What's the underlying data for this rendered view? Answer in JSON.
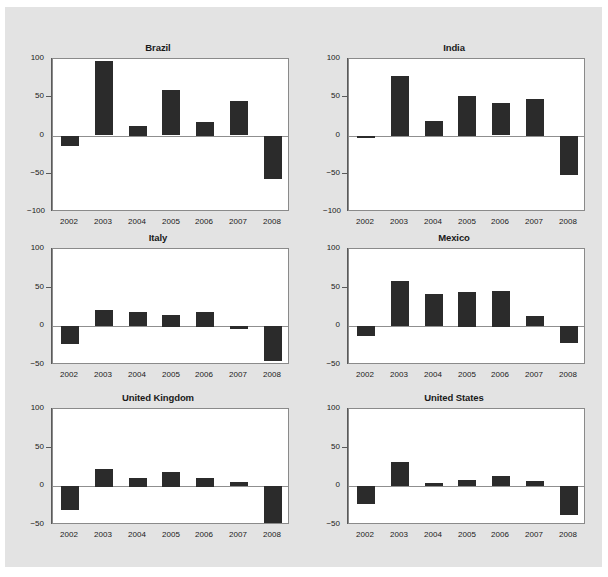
{
  "figure": {
    "background_color": "#e3e3e3",
    "panel_background_color": "#ffffff",
    "bar_color": "#2b2b2b",
    "axis_color": "#5a5a5a"
  },
  "chart_data": {
    "type": "bar",
    "title": "",
    "subtitle": "",
    "xlabel": "",
    "ylabel": "",
    "grid": false,
    "legend": "none",
    "layout": "small-multiples 3 rows x 2 columns",
    "categories": [
      "2002",
      "2003",
      "2004",
      "2005",
      "2006",
      "2007",
      "2008"
    ],
    "panels": [
      {
        "title": "Brazil",
        "ylim": [
          -100,
          100
        ],
        "yticks": [
          -100,
          -50,
          0,
          50,
          100
        ],
        "ytick_labels": [
          "−100",
          "−50",
          "0",
          "50",
          "100"
        ],
        "values": [
          -13,
          97,
          13,
          59,
          18,
          45,
          -56
        ]
      },
      {
        "title": "India",
        "ylim": [
          -100,
          100
        ],
        "yticks": [
          -100,
          -50,
          0,
          50,
          100
        ],
        "ytick_labels": [
          "−100",
          "−50",
          "0",
          "50",
          "100"
        ],
        "values": [
          -2,
          78,
          19,
          52,
          42,
          48,
          -51
        ]
      },
      {
        "title": "Italy",
        "ylim": [
          -50,
          100
        ],
        "yticks": [
          -50,
          0,
          50,
          100
        ],
        "ytick_labels": [
          "−50",
          "0",
          "50",
          "100"
        ],
        "values": [
          -23,
          21,
          18,
          15,
          19,
          -4,
          -45
        ]
      },
      {
        "title": "Mexico",
        "ylim": [
          -50,
          100
        ],
        "yticks": [
          -50,
          0,
          50,
          100
        ],
        "ytick_labels": [
          "−50",
          "0",
          "50",
          "100"
        ],
        "values": [
          -13,
          58,
          42,
          45,
          46,
          13,
          -22
        ]
      },
      {
        "title": "United Kingdom",
        "ylim": [
          -50,
          100
        ],
        "yticks": [
          -50,
          0,
          50,
          100
        ],
        "ytick_labels": [
          "−50",
          "0",
          "50",
          "100"
        ],
        "values": [
          -31,
          23,
          11,
          19,
          11,
          5,
          -49
        ]
      },
      {
        "title": "United States",
        "ylim": [
          -50,
          100
        ],
        "yticks": [
          -50,
          0,
          50,
          100
        ],
        "ytick_labels": [
          "−50",
          "0",
          "50",
          "100"
        ],
        "values": [
          -23,
          31,
          4,
          8,
          13,
          7,
          -37
        ]
      }
    ]
  }
}
